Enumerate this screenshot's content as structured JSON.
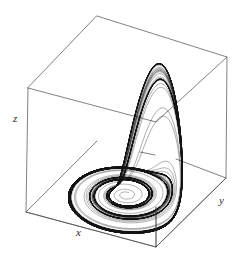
{
  "figure": {
    "title": "",
    "background_color": "#ffffff",
    "width": 242,
    "height": 263
  },
  "axes": {
    "x_label": "x",
    "y_label": "y",
    "z_label": "z",
    "box_color": "#4a4a4a",
    "box_line_width": 0.7,
    "ticks_visible": "false",
    "tick_labels": []
  },
  "chart_data": {
    "type": "line",
    "title": "",
    "subtitle": "",
    "xlabel": "x",
    "ylabel": "y",
    "zlabel": "z",
    "projection": "3d",
    "grid": "off",
    "legend": "none",
    "curve_color": "#000000",
    "curve_label": "Rossler attractor trajectory",
    "xlim": [
      -12,
      12
    ],
    "ylim": [
      -12,
      12
    ],
    "zlim": [
      0,
      24
    ],
    "box_corners_px": {
      "top_back": [
        97,
        16
      ],
      "top_left": [
        28,
        88
      ],
      "top_right": [
        227,
        57
      ],
      "top_front": [
        156,
        122
      ],
      "bottom_left": [
        26,
        212
      ],
      "bottom_right": [
        226,
        178
      ],
      "bottom_front": [
        156,
        247
      ]
    },
    "attractor": {
      "name": "Rossler",
      "parameters": {
        "a": 0.2,
        "b": 0.2,
        "c": 5.7
      },
      "initial_conditions": [
        0.1,
        0.0,
        0.0
      ],
      "dt": 0.01,
      "steps": 90000,
      "band_turns": 34,
      "flat_band_center_px": [
        116,
        183
      ],
      "flat_band_radius_px": [
        60,
        43
      ],
      "fold_tip_px": [
        170,
        70
      ]
    },
    "x": [],
    "y": [],
    "values": []
  }
}
